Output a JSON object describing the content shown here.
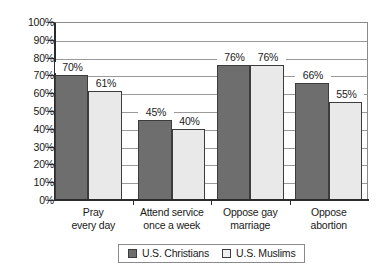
{
  "chart_data": {
    "type": "bar",
    "title": "",
    "subtitle": "",
    "xlabel": "",
    "ylabel": "",
    "ylim": [
      0,
      100
    ],
    "grid": true,
    "legend_position": "bottom-center",
    "categories": [
      "Pray\never#y day",
      "Attend service\nonce a week",
      "Oppose gay\nmarriage",
      "Oppose\nabortion"
    ],
    "category_lines": [
      [
        "Pray",
        "every day"
      ],
      [
        "Attend service",
        "once a week"
      ],
      [
        "Oppose gay",
        "marriage"
      ],
      [
        "Oppose",
        "abortion"
      ]
    ],
    "series": [
      {
        "name": "U.S. Christians",
        "color": "#6e6e6e",
        "values": [
          70,
          45,
          76,
          66
        ],
        "value_labels": [
          "70%",
          "45%",
          "76%",
          "66%"
        ]
      },
      {
        "name": "U.S. Muslims",
        "color": "#e9e9e9",
        "values": [
          61,
          40,
          76,
          55
        ],
        "value_labels": [
          "61%",
          "40%",
          "76%",
          "55%"
        ]
      }
    ],
    "y_ticks": [
      0,
      10,
      20,
      30,
      40,
      50,
      60,
      70,
      80,
      90,
      100
    ],
    "y_tick_labels": [
      "0%",
      "10%",
      "20%",
      "30%",
      "40%",
      "50%",
      "60%",
      "70%",
      "80%",
      "90%",
      "100%"
    ]
  },
  "legend": {
    "entries": [
      {
        "label": "U.S. Christians"
      },
      {
        "label": "U.S. Muslims"
      }
    ]
  },
  "colors": {
    "series_christians": "#6e6e6e",
    "series_muslims": "#e9e9e9",
    "axis": "#2b2b2b",
    "grid": "#9a9a9a",
    "background": "#ffffff"
  }
}
